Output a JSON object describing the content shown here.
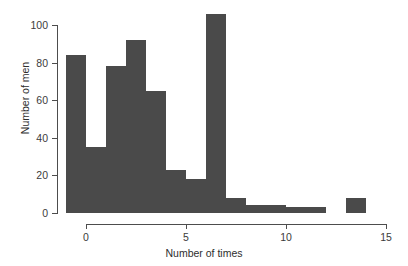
{
  "chart_data": {
    "type": "bar",
    "title": "",
    "subtitle": "",
    "xlabel": "Number of times",
    "ylabel": "Number of men",
    "xlim": [
      -1,
      15
    ],
    "ylim": [
      0,
      107
    ],
    "xticks": [
      0,
      5,
      10,
      15
    ],
    "xtick_labels": [
      "0",
      "5",
      "10",
      "15"
    ],
    "yticks": [
      0,
      20,
      40,
      60,
      80,
      100
    ],
    "ytick_labels": [
      "0",
      "20",
      "40",
      "60",
      "80",
      "100"
    ],
    "grid": false,
    "legend": false,
    "bar_color": "#4a4a4a",
    "bin_width": 1,
    "categories": [
      -1,
      0,
      1,
      2,
      3,
      4,
      5,
      6,
      7,
      8,
      9,
      10,
      11,
      13
    ],
    "bins": [
      {
        "x_left": -1,
        "x_right": 0,
        "value": 84
      },
      {
        "x_left": 0,
        "x_right": 1,
        "value": 35
      },
      {
        "x_left": 1,
        "x_right": 2,
        "value": 78
      },
      {
        "x_left": 2,
        "x_right": 3,
        "value": 92
      },
      {
        "x_left": 3,
        "x_right": 4,
        "value": 65
      },
      {
        "x_left": 4,
        "x_right": 5,
        "value": 23
      },
      {
        "x_left": 5,
        "x_right": 6,
        "value": 18
      },
      {
        "x_left": 6,
        "x_right": 7,
        "value": 106
      },
      {
        "x_left": 7,
        "x_right": 8,
        "value": 8
      },
      {
        "x_left": 8,
        "x_right": 9,
        "value": 4
      },
      {
        "x_left": 9,
        "x_right": 10,
        "value": 4
      },
      {
        "x_left": 10,
        "x_right": 11,
        "value": 3
      },
      {
        "x_left": 11,
        "x_right": 12,
        "value": 3
      },
      {
        "x_left": 13,
        "x_right": 14,
        "value": 8
      }
    ],
    "values": [
      84,
      35,
      78,
      92,
      65,
      23,
      18,
      106,
      8,
      4,
      4,
      3,
      3,
      8
    ]
  }
}
